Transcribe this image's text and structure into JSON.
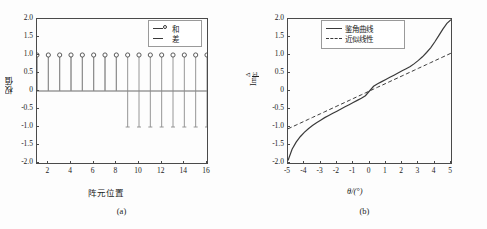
{
  "figure": {
    "panels": [
      "a",
      "b"
    ]
  },
  "panel_a": {
    "caption": "(a)",
    "xlabel": "阵元位置",
    "ylabel": "权值",
    "legend": [
      {
        "label": "和",
        "style": "line-marker",
        "marker": "circle"
      },
      {
        "label": "差",
        "style": "line"
      }
    ]
  },
  "panel_b": {
    "caption": "(b)",
    "xlabel": "θ/(°)",
    "ylabel_prefix": "Im",
    "ylabel_num": "Δ",
    "ylabel_den": "Σ",
    "legend": [
      {
        "label": "鉴角曲线",
        "style": "solid"
      },
      {
        "label": "近似线性",
        "style": "dashed"
      }
    ]
  },
  "chart_data": [
    {
      "type": "bar",
      "subplot": "a",
      "title": "",
      "xlabel": "阵元位置",
      "ylabel": "权值",
      "xlim": [
        1,
        16
      ],
      "ylim": [
        -2.0,
        2.0
      ],
      "xticks": [
        2,
        4,
        6,
        8,
        10,
        12,
        14,
        16
      ],
      "yticks": [
        -2.0,
        -1.5,
        -1.0,
        -0.5,
        0,
        0.5,
        1.0,
        1.5,
        2.0
      ],
      "ytick_labels": [
        "-2.0",
        "-1.5",
        "-1.0",
        "-0.5",
        "0",
        "0.5",
        "1.0",
        "1.5",
        "2.0"
      ],
      "grid": false,
      "legend_position": "upper-right",
      "x": [
        1,
        2,
        3,
        4,
        5,
        6,
        7,
        8,
        9,
        10,
        11,
        12,
        13,
        14,
        15,
        16
      ],
      "series": [
        {
          "name": "和",
          "marker": "circle",
          "values": [
            1,
            1,
            1,
            1,
            1,
            1,
            1,
            1,
            1,
            1,
            1,
            1,
            1,
            1,
            1,
            1
          ]
        },
        {
          "name": "差",
          "marker": "none",
          "values": [
            1,
            1,
            1,
            1,
            1,
            1,
            1,
            1,
            -1,
            -1,
            -1,
            -1,
            -1,
            -1,
            -1,
            -1
          ]
        }
      ]
    },
    {
      "type": "line",
      "subplot": "b",
      "title": "",
      "xlabel": "θ/(°)",
      "ylabel": "Im[Δ/Σ]",
      "xlim": [
        -5,
        5
      ],
      "ylim": [
        -2.0,
        2.0
      ],
      "xticks": [
        -5,
        -4,
        -3,
        -2,
        -1,
        0,
        1,
        2,
        3,
        4,
        5
      ],
      "yticks": [
        -2.0,
        -1.5,
        -1.0,
        -0.5,
        0,
        0.5,
        1.0,
        1.5,
        2.0
      ],
      "ytick_labels": [
        "-2.0",
        "-1.5",
        "-1.0",
        "-0.5",
        "0",
        "0.5",
        "1.0",
        "1.5",
        "2.0"
      ],
      "grid": false,
      "legend_position": "upper-left",
      "x": [
        -5,
        -4.75,
        -4.5,
        -4.25,
        -4,
        -3.75,
        -3.5,
        -3.25,
        -3,
        -2.75,
        -2.5,
        -2.25,
        -2,
        -1.75,
        -1.5,
        -1.25,
        -1,
        -0.75,
        -0.5,
        -0.25,
        0,
        0.25,
        0.5,
        0.75,
        1,
        1.25,
        1.5,
        1.75,
        2,
        2.25,
        2.5,
        2.75,
        3,
        3.25,
        3.5,
        3.75,
        4,
        4.25,
        4.5,
        4.75,
        5
      ],
      "series": [
        {
          "name": "鉴角曲线",
          "style": "solid",
          "values": [
            -1.93,
            -1.62,
            -1.42,
            -1.27,
            -1.15,
            -1.05,
            -0.96,
            -0.88,
            -0.81,
            -0.74,
            -0.68,
            -0.62,
            -0.56,
            -0.5,
            -0.44,
            -0.38,
            -0.32,
            -0.26,
            -0.2,
            -0.13,
            0,
            0.13,
            0.2,
            0.26,
            0.32,
            0.38,
            0.44,
            0.5,
            0.56,
            0.62,
            0.68,
            0.76,
            0.85,
            0.95,
            1.07,
            1.2,
            1.36,
            1.54,
            1.72,
            1.88,
            1.98
          ]
        },
        {
          "name": "近似线性",
          "style": "dashed",
          "slope": 0.21,
          "intercept": 0,
          "values": [
            -1.05,
            -0.9975,
            -0.945,
            -0.8925,
            -0.84,
            -0.7875,
            -0.735,
            -0.6825,
            -0.63,
            -0.5775,
            -0.525,
            -0.4725,
            -0.42,
            -0.3675,
            -0.315,
            -0.2625,
            -0.21,
            -0.1575,
            -0.105,
            -0.0525,
            0,
            0.0525,
            0.105,
            0.1575,
            0.21,
            0.2625,
            0.315,
            0.3675,
            0.42,
            0.4725,
            0.525,
            0.5775,
            0.63,
            0.6825,
            0.735,
            0.7875,
            0.84,
            0.8925,
            0.945,
            0.9975,
            1.05
          ]
        }
      ]
    }
  ],
  "colors": {
    "axis": "#4a4a4a",
    "curve": "#3a3a3a",
    "stem": "#8a8a8a",
    "baseline": "#6a6a6a"
  }
}
